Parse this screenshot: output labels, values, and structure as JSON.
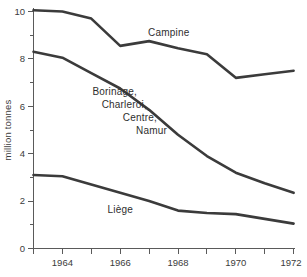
{
  "chart_data": {
    "type": "line",
    "title": "",
    "subtitle": "",
    "xlabel": "",
    "ylabel": "million tonnes",
    "xlim": [
      1963,
      1972
    ],
    "ylim": [
      0,
      10
    ],
    "grid": false,
    "legend_position": "inline-labels",
    "x": [
      1963,
      1964,
      1965,
      1966,
      1967,
      1968,
      1969,
      1970,
      1971,
      1972
    ],
    "x_tick_values": [
      1963,
      1964,
      1965,
      1966,
      1967,
      1968,
      1969,
      1970,
      1971,
      1972
    ],
    "x_tick_labels": [
      "",
      "1964",
      "",
      "1966",
      "",
      "1968",
      "",
      "1970",
      "",
      "1972"
    ],
    "y_tick_values": [
      0,
      1,
      2,
      3,
      4,
      5,
      6,
      7,
      8,
      9,
      10
    ],
    "y_tick_labels": [
      "0",
      "",
      "2",
      "",
      "4",
      "",
      "6",
      "",
      "8",
      "",
      "10"
    ],
    "series": [
      {
        "name": "Campine",
        "label": "Campine",
        "color": "#3b3b3b",
        "values": [
          10.05,
          10.0,
          9.7,
          8.55,
          8.75,
          8.45,
          8.2,
          7.2,
          7.35,
          7.5
        ]
      },
      {
        "name": "Borinage, Charleroi, Centre, Namur",
        "label": "Borinage,\nCharleroi,\nCentre,\nNamur",
        "label_lines": [
          "Borinage,",
          "Charleroi,",
          "Centre,",
          "Namur"
        ],
        "color": "#3b3b3b",
        "values": [
          8.3,
          8.05,
          7.4,
          6.75,
          5.85,
          4.8,
          3.9,
          3.2,
          2.75,
          2.35
        ]
      },
      {
        "name": "Liège",
        "label": "Liège",
        "color": "#3b3b3b",
        "values": [
          3.1,
          3.05,
          2.7,
          2.35,
          2.0,
          1.6,
          1.5,
          1.45,
          1.25,
          1.05
        ]
      }
    ],
    "annotations": [
      {
        "text": "Campine",
        "x": 1967.0,
        "y": 9.1,
        "align": "start"
      },
      {
        "text": "Borinage,",
        "x": 1966.3,
        "y": 6.95,
        "align": "end"
      },
      {
        "text": "Charleroi,",
        "x": 1966.65,
        "y": 6.4,
        "align": "end"
      },
      {
        "text": "Centre,",
        "x": 1967.0,
        "y": 5.85,
        "align": "end"
      },
      {
        "text": "Namur",
        "x": 1967.35,
        "y": 5.3,
        "align": "end"
      },
      {
        "text": "Liège",
        "x": 1966.6,
        "y": 1.95,
        "align": "end"
      }
    ]
  },
  "axis": {
    "y_title": "million tonnes",
    "y_labels": {
      "t0": "0",
      "t2": "2",
      "t4": "4",
      "t6": "6",
      "t8": "8",
      "t10": "10"
    },
    "x_labels": {
      "y1964": "1964",
      "y1966": "1966",
      "y1968": "1968",
      "y1970": "1970",
      "y1972": "1972"
    }
  },
  "labels": {
    "campine": "Campine",
    "borinage": "Borinage,",
    "charleroi": "Charleroi,",
    "centre": "Centre,",
    "namur": "Namur",
    "liege": "Liège"
  },
  "colors": {
    "line": "#3b3b3b",
    "axis": "#5a5a5a",
    "text": "#2e2e2e",
    "background": "#ffffff"
  }
}
